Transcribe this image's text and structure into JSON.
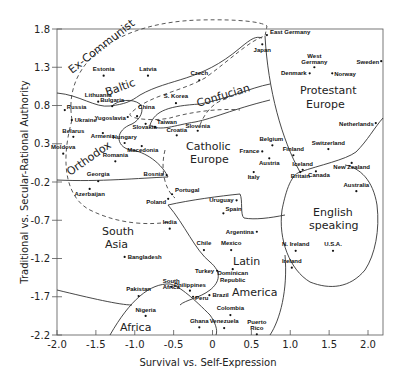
{
  "chart_data": {
    "type": "scatter",
    "title": "",
    "xlabel": "Survival vs. Self-Expression",
    "ylabel": "Traditional vs. Secular-Rational Authority",
    "xlim": [
      -2.0,
      2.2
    ],
    "ylim": [
      -2.2,
      1.8
    ],
    "x_ticks": [
      -2.0,
      -1.5,
      -1.0,
      -0.5,
      0,
      0.5,
      1.0,
      1.5,
      2.0
    ],
    "x_tick_labels": [
      "-2.0",
      "-1.5",
      "-1.0",
      "-0.5",
      "0",
      "0.5",
      "1.0",
      "1.5",
      "2.0"
    ],
    "y_ticks": [
      1.8,
      1.3,
      0.8,
      0.3,
      -0.2,
      -0.7,
      -1.2,
      -1.7,
      -2.2
    ],
    "y_tick_labels": [
      "1.8",
      "1.3",
      "0.8",
      "0.3",
      "-0.2",
      "-0.7",
      "-1.2",
      "-1.7",
      "-2.2"
    ],
    "grid": false,
    "legend": null,
    "points": [
      {
        "name": "East Germany",
        "x": 0.7,
        "y": 1.72
      },
      {
        "name": "Japan",
        "x": 0.64,
        "y": 1.6
      },
      {
        "name": "Estonia",
        "x": -1.4,
        "y": 1.19
      },
      {
        "name": "Latvia",
        "x": -0.83,
        "y": 1.19
      },
      {
        "name": "Czech",
        "x": -0.17,
        "y": 1.13
      },
      {
        "name": "West Germany",
        "x": 1.31,
        "y": 1.3
      },
      {
        "name": "Denmark",
        "x": 1.25,
        "y": 1.22
      },
      {
        "name": "Norway",
        "x": 1.54,
        "y": 1.22
      },
      {
        "name": "Sweden",
        "x": 2.17,
        "y": 1.38
      },
      {
        "name": "Lithuania",
        "x": -1.47,
        "y": 0.85
      },
      {
        "name": "Russia",
        "x": -1.9,
        "y": 0.74
      },
      {
        "name": "Ukraine",
        "x": -1.81,
        "y": 0.61
      },
      {
        "name": "Bulgaria",
        "x": -1.29,
        "y": 0.79
      },
      {
        "name": "Yugoslavia",
        "x": -1.09,
        "y": 0.65
      },
      {
        "name": "China",
        "x": -0.97,
        "y": 0.66
      },
      {
        "name": "S. Korea",
        "x": -0.47,
        "y": 0.83
      },
      {
        "name": "Taiwan",
        "x": -0.74,
        "y": 0.52
      },
      {
        "name": "Slovakia",
        "x": -0.86,
        "y": 0.56
      },
      {
        "name": "Croatia",
        "x": -0.46,
        "y": 0.41
      },
      {
        "name": "Slovenia",
        "x": -0.19,
        "y": 0.47
      },
      {
        "name": "Belarus",
        "x": -1.79,
        "y": 0.39
      },
      {
        "name": "Armenia",
        "x": -1.41,
        "y": 0.44
      },
      {
        "name": "Hungary",
        "x": -1.13,
        "y": 0.31
      },
      {
        "name": "Macedonia",
        "x": -0.91,
        "y": 0.27
      },
      {
        "name": "Moldova",
        "x": -1.92,
        "y": 0.17
      },
      {
        "name": "Romania",
        "x": -1.25,
        "y": 0.07
      },
      {
        "name": "Georgia",
        "x": -1.47,
        "y": -0.19
      },
      {
        "name": "Bosnia",
        "x": -0.59,
        "y": -0.11
      },
      {
        "name": "Azerbaijan",
        "x": -1.58,
        "y": -0.29
      },
      {
        "name": "Portugal",
        "x": -0.52,
        "y": -0.36
      },
      {
        "name": "Poland",
        "x": -0.57,
        "y": -0.42
      },
      {
        "name": "Finland",
        "x": 1.04,
        "y": 0.15
      },
      {
        "name": "Switzerland",
        "x": 1.49,
        "y": 0.23
      },
      {
        "name": "Netherlands",
        "x": 2.1,
        "y": 0.57
      },
      {
        "name": "Belgium",
        "x": 0.77,
        "y": 0.28
      },
      {
        "name": "France",
        "x": 0.64,
        "y": 0.2
      },
      {
        "name": "Austria",
        "x": 0.73,
        "y": 0.11
      },
      {
        "name": "Italy",
        "x": 0.53,
        "y": -0.07
      },
      {
        "name": "Iceland",
        "x": 1.16,
        "y": -0.04
      },
      {
        "name": "Britain",
        "x": 1.13,
        "y": -0.07
      },
      {
        "name": "Canada",
        "x": 1.33,
        "y": -0.06
      },
      {
        "name": "New Zealand",
        "x": 1.79,
        "y": 0.05
      },
      {
        "name": "Australia",
        "x": 1.85,
        "y": -0.32
      },
      {
        "name": "Uruguay",
        "x": 0.31,
        "y": -0.44
      },
      {
        "name": "Spain",
        "x": 0.14,
        "y": -0.61
      },
      {
        "name": "Argentina",
        "x": 0.57,
        "y": -0.85
      },
      {
        "name": "India",
        "x": -0.55,
        "y": -0.81
      },
      {
        "name": "Chile",
        "x": -0.11,
        "y": -1.09
      },
      {
        "name": "Mexico",
        "x": 0.24,
        "y": -1.09
      },
      {
        "name": "N. Ireland",
        "x": 1.07,
        "y": -1.1
      },
      {
        "name": "U.S.A.",
        "x": 1.55,
        "y": -1.1
      },
      {
        "name": "Ireland",
        "x": 1.02,
        "y": -1.32
      },
      {
        "name": "Bangladesh",
        "x": -1.13,
        "y": -1.18
      },
      {
        "name": "Turkey",
        "x": 0.06,
        "y": -1.36
      },
      {
        "name": "Dominican Republic",
        "x": 0.26,
        "y": -1.34
      },
      {
        "name": "Philippines",
        "x": -0.29,
        "y": -1.62
      },
      {
        "name": "Pakistan",
        "x": -0.95,
        "y": -1.69
      },
      {
        "name": "South Africa",
        "x": -0.53,
        "y": -1.57
      },
      {
        "name": "Peru",
        "x": -0.25,
        "y": -1.7
      },
      {
        "name": "Brazil",
        "x": -0.04,
        "y": -1.68
      },
      {
        "name": "Nigeria",
        "x": -0.86,
        "y": -1.95
      },
      {
        "name": "Colombia",
        "x": 0.23,
        "y": -1.94
      },
      {
        "name": "Ghana",
        "x": -0.17,
        "y": -2.1
      },
      {
        "name": "Venezuela",
        "x": 0.15,
        "y": -2.11
      },
      {
        "name": "Puerto Rico",
        "x": 0.57,
        "y": -2.19
      }
    ],
    "regions": [
      {
        "name": "Ex-Communist",
        "style": "dashed"
      },
      {
        "name": "Baltic",
        "style": "solid"
      },
      {
        "name": "Orthodox",
        "style": "solid"
      },
      {
        "name": "Confucian",
        "style": "solid"
      },
      {
        "name": "Catholic Europe",
        "style": "solid"
      },
      {
        "name": "Protestant Europe",
        "style": "solid"
      },
      {
        "name": "English speaking",
        "style": "solid"
      },
      {
        "name": "South Asia",
        "style": "solid"
      },
      {
        "name": "Latin America",
        "style": "solid"
      },
      {
        "name": "Africa",
        "style": "solid"
      }
    ]
  },
  "axes": {
    "xlabel": "Survival vs. Self-Expression",
    "ylabel": "Traditional vs. Secular-Rational Authority"
  },
  "region_labels": {
    "ex_communist": "Ex-Communist",
    "baltic": "Baltic",
    "orthodox": "Orthodox",
    "confucian": "Confucian",
    "catholic_1": "Catholic",
    "catholic_2": "Europe",
    "protestant_1": "Protestant",
    "protestant_2": "Europe",
    "english_1": "English",
    "english_2": "speaking",
    "south_asia_1": "South",
    "south_asia_2": "Asia",
    "latin_1": "Latin",
    "latin_2": "America",
    "africa": "Africa"
  },
  "colors": {
    "ink": "#222222",
    "background": "#ffffff"
  }
}
